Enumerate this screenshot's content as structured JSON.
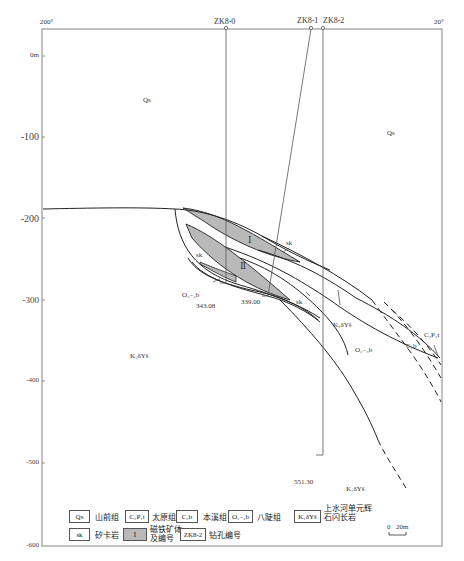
{
  "figure": {
    "type": "geological-cross-section",
    "azimuth_left": "200°",
    "azimuth_right": "20°"
  },
  "boreholes": [
    {
      "id": "ZK8-0",
      "end_depth_label": "343.08"
    },
    {
      "id": "ZK8-1",
      "end_depth_label": "339.00"
    },
    {
      "id": "ZK8-2",
      "end_depth_label": "551.30"
    }
  ],
  "elevation_axis": {
    "ticks": [
      "0m",
      "-100",
      "-200",
      "-300",
      "-400",
      "-500",
      "-600"
    ]
  },
  "map_labels": {
    "qs_left": "Qs",
    "qs_right": "Qs",
    "ore_body_1": "Ⅰ",
    "ore_body_2": "Ⅱ",
    "sk_1": "sk",
    "sk_2": "sk",
    "sk_3": "sk",
    "o_lower": "O₂₋₃b",
    "o_right": "O₂₋₃b",
    "k_left": "K₁δYš",
    "k_mid": "K₁δYš",
    "k_bottom": "K₁δYš",
    "c2b": "C₂b",
    "c2p1t": "C₂P₁t"
  },
  "legend": {
    "items": [
      {
        "symbol": "Qs",
        "label": "山前组"
      },
      {
        "symbol": "C₂P₁t",
        "label": "太原组"
      },
      {
        "symbol": "C₂b",
        "label": "本溪组"
      },
      {
        "symbol": "O₂₋₃b",
        "label": "八陡组"
      },
      {
        "symbol": "K₁δYš",
        "label": "上水河单元辉石闪长岩"
      },
      {
        "symbol": "sk",
        "label": "矽卡岩"
      },
      {
        "symbol": "Ⅰ",
        "label": "磁铁矿体及编号"
      },
      {
        "symbol": "ZK8-2",
        "label": "钻孔编号"
      }
    ],
    "labels_split": {
      "k_line1": "上水河单元辉",
      "k_line2": "石闪长岩",
      "ore_line1": "磁铁矿体",
      "ore_line2": "及编号"
    }
  },
  "scale_bar": {
    "start": "0",
    "end": "20m"
  },
  "colors": {
    "ore_fill": "#b9b9b9",
    "line": "#2a2a2a",
    "frame": "#777777"
  }
}
